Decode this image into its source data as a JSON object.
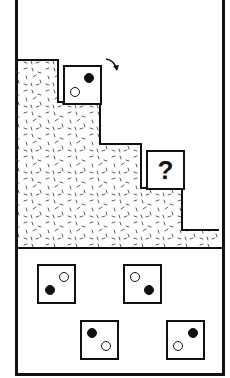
{
  "puzzle": {
    "type": "spatial-rotation-staircase",
    "question_mark": "?",
    "rotation_hint": "clockwise-arrow",
    "colors": {
      "ink": "#111111",
      "background": "#ffffff"
    },
    "given_tile": {
      "filled_dot": "top-right",
      "hollow_dot": "bottom-left"
    },
    "options": [
      {
        "id": "A",
        "filled_dot": "bottom-left",
        "hollow_dot": "top-right"
      },
      {
        "id": "B",
        "filled_dot": "bottom-right",
        "hollow_dot": "top-left"
      },
      {
        "id": "C",
        "filled_dot": "top-left",
        "hollow_dot": "bottom-right"
      },
      {
        "id": "D",
        "filled_dot": "top-right",
        "hollow_dot": "bottom-left"
      }
    ]
  }
}
